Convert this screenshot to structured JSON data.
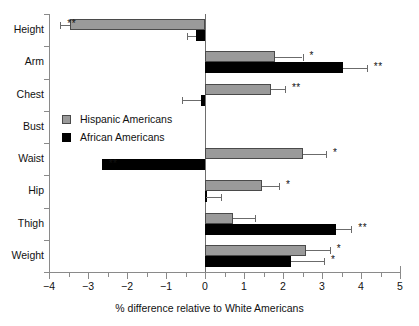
{
  "chart_data": {
    "type": "bar",
    "orientation": "horizontal",
    "title": "",
    "xlabel": "% difference relative to White Americans",
    "ylabel": "",
    "xlim": [
      -4,
      5
    ],
    "xticks": [
      -4,
      -3,
      -2,
      -1,
      0,
      1,
      2,
      3,
      4,
      5
    ],
    "xticklabels": [
      "−4",
      "−3",
      "−2",
      "−1",
      "0",
      "1",
      "2",
      "3",
      "4",
      "5"
    ],
    "grid": false,
    "legend_position": "inside-left-middle",
    "zero_reference_line": true,
    "categories": [
      "Height",
      "Arm",
      "Chest",
      "Bust",
      "Waist",
      "Hip",
      "Thigh",
      "Weight"
    ],
    "series": [
      {
        "name": "Hispanic Americans",
        "color": "#9a9a9a",
        "values": [
          -3.46,
          1.8,
          1.7,
          null,
          2.5,
          1.45,
          0.72,
          2.6
        ],
        "errors": [
          0.25,
          0.7,
          0.35,
          null,
          0.6,
          0.45,
          0.55,
          0.6
        ],
        "significance": [
          "**",
          "*",
          "**",
          "",
          "*",
          "*",
          "",
          "*"
        ]
      },
      {
        "name": "African Americans",
        "color": "#000000",
        "values": [
          -0.23,
          3.55,
          -0.1,
          null,
          -2.65,
          0.02,
          3.35,
          2.2
        ],
        "errors": [
          0.22,
          0.6,
          0.5,
          null,
          0.0,
          0.38,
          0.4,
          0.85
        ],
        "significance": [
          "",
          "**",
          "",
          "",
          "**",
          "",
          "**",
          "*"
        ]
      }
    ],
    "notes": {
      "bust_row": "no data plotted for Bust category",
      "significance_key_star": "*",
      "significance_key_double_star": "**"
    }
  },
  "legend": {
    "items": [
      {
        "label": "Hispanic Americans",
        "swatch": "gray-square-icon"
      },
      {
        "label": "African Americans",
        "swatch": "black-square-icon"
      }
    ]
  },
  "axis": {
    "x_title": "% difference relative to White Americans"
  }
}
